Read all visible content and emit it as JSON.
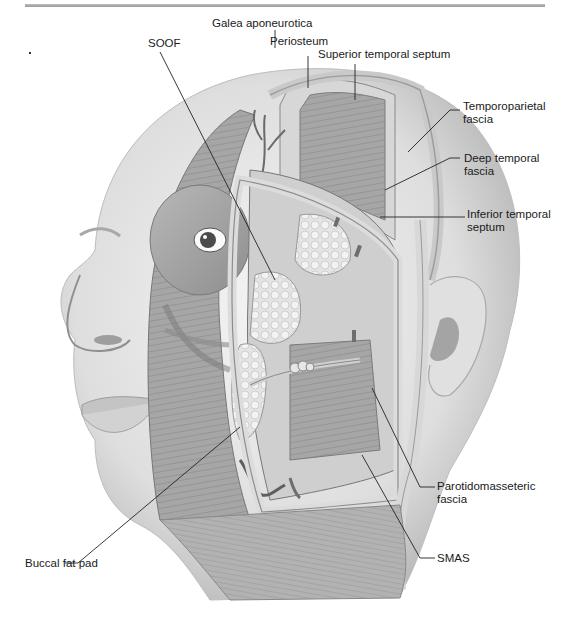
{
  "figure": {
    "labels": [
      {
        "id": "soof",
        "text": "SOOF"
      },
      {
        "id": "galea",
        "text": "Galea aponeurotica"
      },
      {
        "id": "periosteum",
        "text": "Periosteum"
      },
      {
        "id": "superior-temporal-septum",
        "text": "Superior temporal septum"
      },
      {
        "id": "temporoparietal-fascia",
        "line1": "Temporoparietal",
        "line2": "fascia"
      },
      {
        "id": "deep-temporal-fascia",
        "line1": "Deep temporal",
        "line2": "fascia"
      },
      {
        "id": "inferior-temporal-septum",
        "line1": "Inferior temporal",
        "line2": "septum"
      },
      {
        "id": "parotidomasseteric-fascia",
        "line1": "Parotidomasseteric",
        "line2": "fascia"
      },
      {
        "id": "smas",
        "text": "SMAS"
      },
      {
        "id": "buccal-fat-pad",
        "text": "Buccal fat pad"
      }
    ]
  },
  "colors": {
    "skin": "#e9e9e9",
    "muscle": "#a9a9a9",
    "fascia": "#d6d6d6",
    "fat": "#efefef",
    "line": "#222222"
  }
}
